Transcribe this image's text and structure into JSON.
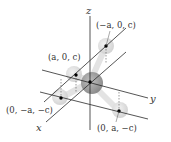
{
  "diagram": {
    "title": "",
    "axes": {
      "x": {
        "label": "x"
      },
      "y": {
        "label": "y"
      },
      "z": {
        "label": "z"
      }
    },
    "center_atom": {
      "position": "origin"
    },
    "atoms": [
      {
        "label": "(−a, 0, c)"
      },
      {
        "label": "(a, 0, c)"
      },
      {
        "label": "(0, −a, −c)"
      },
      {
        "label": "(0, a, −c)"
      }
    ],
    "colors": {
      "line": "#2a2a2a",
      "center_atom": "#8f8f8f",
      "outer_atom": "#d9d9d9",
      "bond": "#e6e6e6",
      "dot": "#000000"
    }
  }
}
